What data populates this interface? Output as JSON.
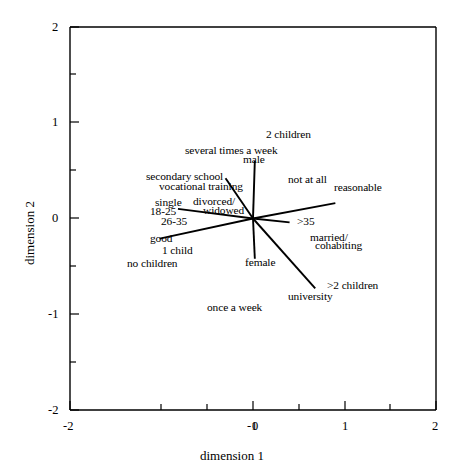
{
  "chart_data": {
    "type": "scatter",
    "title": "",
    "xlabel": "dimension 1",
    "ylabel": "dimension 2",
    "xlim": [
      -2,
      2
    ],
    "ylim": [
      -2,
      2
    ],
    "xticks": [
      -2,
      -1,
      0,
      1,
      2
    ],
    "yticks": [
      -2,
      -1,
      0,
      1,
      2
    ],
    "xtick_labels": [
      "-2",
      "-1",
      "0",
      "1",
      "2"
    ],
    "ytick_labels": [
      "-2",
      "-1",
      "0",
      "1",
      "2"
    ],
    "minor_ticks": true,
    "grid": false,
    "legend": null,
    "origin": [
      0,
      0
    ],
    "note": "Correspondence-analysis biplot: labelled category points, several joined to the origin by straight lines.",
    "points": [
      {
        "label": "2 children",
        "x": 0.17,
        "y": 0.77,
        "line": false
      },
      {
        "label": "several times a week",
        "x": -0.28,
        "y": 0.63,
        "line": false
      },
      {
        "label": "male",
        "x": 0.02,
        "y": 0.52,
        "line": true,
        "lx": 0.02,
        "ly": 0.6
      },
      {
        "label": "secondary school",
        "x": -0.7,
        "y": 0.4,
        "line": false
      },
      {
        "label": "not at all",
        "x": 0.52,
        "y": 0.4,
        "line": false
      },
      {
        "label": "vocational training",
        "x": -0.58,
        "y": 0.3,
        "line": true,
        "lx": -0.3,
        "ly": 0.42
      },
      {
        "label": "reasonable",
        "x": 1.07,
        "y": 0.23,
        "line": true,
        "lx": 0.9,
        "ly": 0.16
      },
      {
        "label": "single",
        "x": -0.86,
        "y": 0.1,
        "line": false
      },
      {
        "label": "divorced/ widowed",
        "x": -0.45,
        "y": 0.09,
        "line": true,
        "lx": -0.82,
        "ly": 0.1
      },
      {
        "label": "18-25",
        "x": -1.03,
        "y": 0.02,
        "line": false
      },
      {
        "label": "26-35",
        "x": -0.95,
        "y": -0.07,
        "line": false
      },
      {
        "label": ">35",
        "x": 0.47,
        "y": -0.07,
        "line": true,
        "lx": 0.4,
        "ly": -0.04
      },
      {
        "label": "good",
        "x": -1.02,
        "y": -0.23,
        "line": true,
        "lx": -1.02,
        "ly": -0.21
      },
      {
        "label": "married/ cohabiting",
        "x": 0.72,
        "y": -0.27,
        "line": false
      },
      {
        "label": "1 child",
        "x": -0.86,
        "y": -0.33,
        "line": false
      },
      {
        "label": "no children",
        "x": -1.1,
        "y": -0.44,
        "line": false
      },
      {
        "label": "female",
        "x": 0.04,
        "y": -0.43,
        "line": true,
        "lx": 0.02,
        "ly": -0.42
      },
      {
        "label": ">2 children",
        "x": 0.92,
        "y": -0.74,
        "line": true,
        "lx": 0.68,
        "ly": -0.73
      },
      {
        "label": "university",
        "x": 0.58,
        "y": -0.84,
        "line": false
      },
      {
        "label": "once a week",
        "x": -0.22,
        "y": -0.95,
        "line": false
      }
    ]
  },
  "axes": {
    "x_title": "dimension 1",
    "y_title": "dimension 2",
    "x_tick_labels": [
      "-2",
      "-1",
      "0",
      "1",
      "2"
    ],
    "y_tick_labels": [
      "2",
      "1",
      "0",
      "-1",
      "-2"
    ]
  },
  "labels": {
    "l_2_children": "2 children",
    "l_several_times": "several times a week",
    "l_male": "male",
    "l_secondary_school": "secondary  school",
    "l_not_at_all": "not at all",
    "l_vocational": "vocational training",
    "l_reasonable": "reasonable",
    "l_single": "single",
    "l_divorced": "divorced/",
    "l_widowed": "widowed",
    "l_18_25": "18-25",
    "l_26_35": "26-35",
    "l_over35": ">35",
    "l_good": "good",
    "l_married": "married/",
    "l_cohabiting": "cohabiting",
    "l_1_child": "1 child",
    "l_no_children": "no children",
    "l_female": "female",
    "l_gt2_children": ">2 children",
    "l_university": "university",
    "l_once_a_week": "once a week"
  }
}
